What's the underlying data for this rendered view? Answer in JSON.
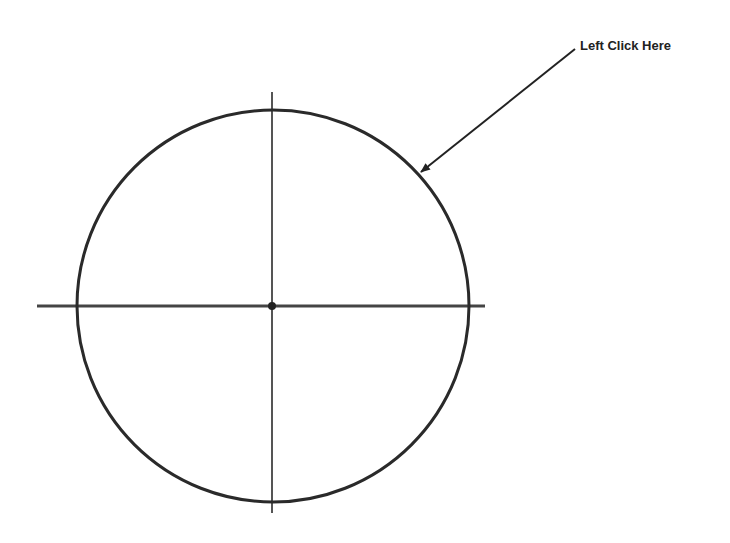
{
  "diagram": {
    "annotation": {
      "text": "Left Click Here",
      "x": 580,
      "y": 38
    },
    "circle": {
      "cx": 273,
      "cy": 306,
      "r": 196,
      "stroke": "#2a2a2a",
      "stroke_width": 3
    },
    "center_point": {
      "cx": 272,
      "cy": 306,
      "r": 4,
      "fill": "#222222"
    },
    "horizontal_axis": {
      "x1": 37,
      "y1": 306,
      "x2": 485,
      "y2": 306,
      "stroke": "#444444",
      "stroke_width": 3
    },
    "vertical_axis": {
      "x1": 272,
      "y1": 92,
      "x2": 272,
      "y2": 513,
      "stroke": "#555555",
      "stroke_width": 2
    },
    "arrow": {
      "x1": 575,
      "y1": 49,
      "x2": 421,
      "y2": 172,
      "stroke": "#222222",
      "stroke_width": 2
    }
  }
}
